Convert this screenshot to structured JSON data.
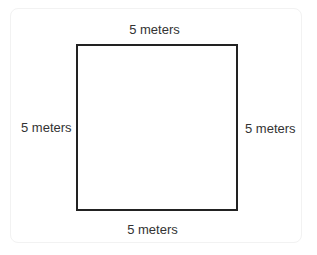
{
  "diagram": {
    "shape": "square",
    "labels": {
      "top": "5 meters",
      "left": "5 meters",
      "right": "5 meters",
      "bottom": "5 meters"
    },
    "colors": {
      "stroke": "#222222",
      "text": "#333333",
      "background": "#ffffff"
    }
  }
}
